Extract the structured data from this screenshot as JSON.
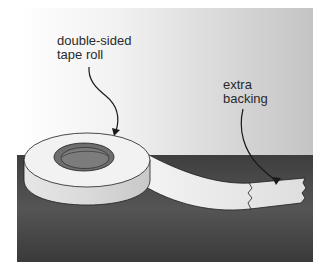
{
  "figure": {
    "title": "",
    "labels": {
      "tape_roll": {
        "line1": "double-sided",
        "line2": "tape roll"
      },
      "extra_backing": {
        "line1": "extra",
        "line2": "backing"
      }
    },
    "colors": {
      "page_bg": "#ffffff",
      "wall_light": "#f4f4f4",
      "wall_dark": "#c9c9c9",
      "table": "#4a4a4a",
      "table_dark": "#333333",
      "tape_light": "#f0f0f0",
      "tape_side": "#d8d8d8",
      "core": "#6e6e6e",
      "outline": "#1e1e1e"
    }
  }
}
